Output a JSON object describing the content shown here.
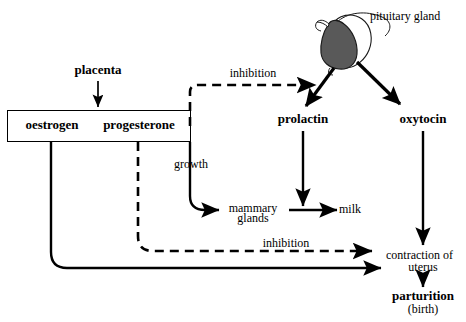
{
  "diagram": {
    "nodes": {
      "placenta": "placenta",
      "oestrogen": "oestrogen",
      "progesterone": "progesterone",
      "pituitary_gland": "pituitary gland",
      "prolactin": "prolactin",
      "oxytocin": "oxytocin",
      "mammary_glands_line1": "mammary",
      "mammary_glands_line2": "glands",
      "milk": "milk",
      "contraction_line1": "contraction of",
      "contraction_line2": "uterus",
      "parturition": "parturition",
      "birth": "(birth)"
    },
    "edge_labels": {
      "inhibition_top": "inhibition",
      "inhibition_bottom": "inhibition",
      "growth": "growth"
    },
    "colors": {
      "stroke": "#000000",
      "gland_fill": "#595959",
      "gland_outline": "#1a1a1a",
      "background": "#ffffff"
    },
    "edges": [
      {
        "from": "placenta",
        "to": "oestrogen/progesterone box",
        "style": "solid"
      },
      {
        "from": "progesterone",
        "to": "prolactin arrow",
        "style": "dashed",
        "label": "inhibition"
      },
      {
        "from": "pituitary gland",
        "to": "prolactin",
        "style": "solid"
      },
      {
        "from": "pituitary gland",
        "to": "oxytocin",
        "style": "solid"
      },
      {
        "from": "progesterone box edge",
        "to": "mammary glands",
        "style": "solid",
        "label": "growth"
      },
      {
        "from": "mammary glands",
        "to": "milk",
        "style": "solid"
      },
      {
        "from": "prolactin",
        "to": "mammary glands to milk arrow",
        "style": "solid"
      },
      {
        "from": "oxytocin",
        "to": "contraction of uterus",
        "style": "solid"
      },
      {
        "from": "progesterone",
        "to": "contraction of uterus",
        "style": "dashed",
        "label": "inhibition"
      },
      {
        "from": "oestrogen",
        "to": "contraction of uterus",
        "style": "solid"
      },
      {
        "from": "contraction of uterus",
        "to": "parturition",
        "style": "solid"
      }
    ]
  }
}
